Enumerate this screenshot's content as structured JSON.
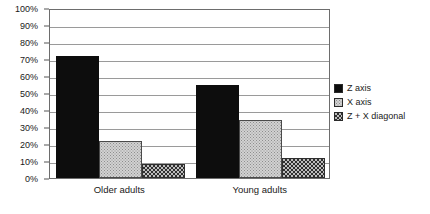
{
  "chart_data": {
    "type": "bar",
    "title": "",
    "xlabel": "",
    "ylabel": "",
    "categories": [
      "Older adults",
      "Young adults"
    ],
    "series": [
      {
        "name": "Z axis",
        "values": [
          71.5,
          55
        ],
        "fill": "solid",
        "color": "#0d0d0d"
      },
      {
        "name": "X axis",
        "values": [
          21.5,
          34
        ],
        "fill": "stipple",
        "color": "#d2d2d2"
      },
      {
        "name": "Z + X diagonal",
        "values": [
          8,
          12
        ],
        "fill": "check",
        "color": "#bdbdbd"
      }
    ],
    "ylim": [
      0,
      100
    ],
    "ytick_values": [
      0,
      10,
      20,
      30,
      40,
      50,
      60,
      70,
      80,
      90,
      100
    ],
    "ytick_labels": [
      "0%",
      "10%",
      "20%",
      "30%",
      "40%",
      "50%",
      "60%",
      "70%",
      "80%",
      "90%",
      "100%"
    ],
    "grid": true,
    "grid_axis": "y",
    "legend_position": "right",
    "plot_border_color": "#6d6d6d",
    "gridline_color": "#9a9a9a",
    "background_color": "#ffffff"
  },
  "legend": {
    "items": [
      {
        "label": "Z axis"
      },
      {
        "label": "X axis"
      },
      {
        "label": "Z + X diagonal"
      }
    ]
  }
}
